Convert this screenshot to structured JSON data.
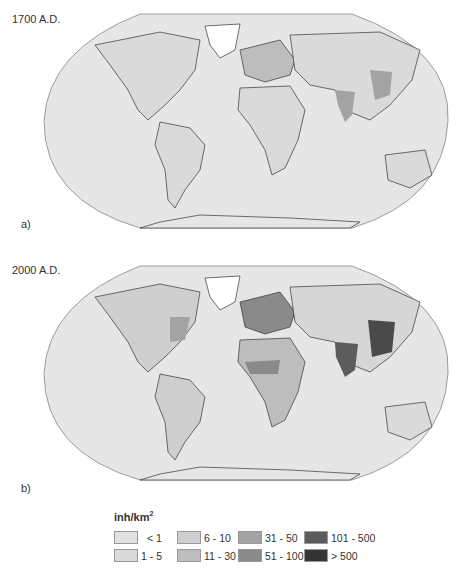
{
  "panels": [
    {
      "year_label": "1700 A.D.",
      "letter": "a)"
    },
    {
      "year_label": "2000 A.D.",
      "letter": "b)"
    }
  ],
  "legend": {
    "title": "inh/km",
    "title_superscript": "2",
    "items": [
      {
        "label": "< 1",
        "color": "#e2e2e2"
      },
      {
        "label": "1 - 5",
        "color": "#dadada"
      },
      {
        "label": "6 - 10",
        "color": "#cfcfcf"
      },
      {
        "label": "11 - 30",
        "color": "#bdbdbd"
      },
      {
        "label": "31 - 50",
        "color": "#a3a3a3"
      },
      {
        "label": "51 - 100",
        "color": "#8a8a8a"
      },
      {
        "label": "101 - 500",
        "color": "#5c5c5c"
      },
      {
        "label": "> 500",
        "color": "#333333"
      }
    ]
  },
  "colors": {
    "ocean": "#e6e6e6",
    "land_base": "#d6d6d6",
    "coastline": "#333333"
  }
}
